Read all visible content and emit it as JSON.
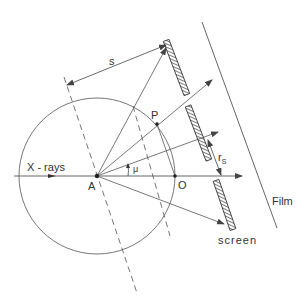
{
  "diagram": {
    "colors": {
      "line": "#555555",
      "text": "#333333",
      "hatch": "#444444",
      "background": "#ffffff"
    },
    "labels": {
      "xrays": "X - rays",
      "A": "A",
      "O": "O",
      "P": "P",
      "mu": "μ",
      "s": "s",
      "rs_main": "r",
      "rs_sub": "S",
      "film": "Film",
      "screen": "screen"
    },
    "points": {
      "A": [
        97,
        176
      ],
      "O": [
        175,
        176
      ],
      "P": [
        157,
        124
      ]
    },
    "circle": {
      "center": [
        97,
        176
      ],
      "radius": 78
    },
    "screen_segments": [
      {
        "from": [
          166,
          40
        ],
        "to": [
          187,
          95
        ]
      },
      {
        "from": [
          188,
          106
        ],
        "to": [
          209,
          160
        ]
      },
      {
        "from": [
          216,
          180
        ],
        "to": [
          233,
          230
        ]
      }
    ],
    "film_line": {
      "from": [
        202,
        22
      ],
      "to": [
        277,
        228
      ]
    }
  }
}
